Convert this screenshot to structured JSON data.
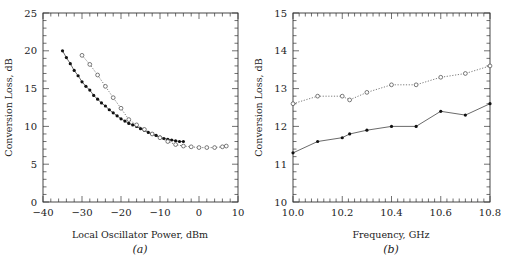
{
  "chart_data": [
    {
      "id": "a",
      "type": "line",
      "caption": "(a)",
      "xlabel": "Local Oscillator Power, dBm",
      "ylabel": "Conversion Loss, dB",
      "xlim": [
        -40,
        10
      ],
      "ylim": [
        0,
        25
      ],
      "xticks": [
        -40,
        -30,
        -20,
        -10,
        0,
        10
      ],
      "xtick_labels": [
        "−40",
        "−30",
        "−20",
        "−10",
        "0",
        "10"
      ],
      "yticks": [
        0,
        5,
        10,
        15,
        20,
        25
      ],
      "ytick_labels": [
        "0",
        "5",
        "10",
        "15",
        "20",
        "25"
      ],
      "grid": false,
      "series": [
        {
          "name": "filled markers (solid line)",
          "marker": "filled-circle",
          "line": "solid",
          "x": [
            -35,
            -34,
            -33,
            -32,
            -31,
            -30,
            -29,
            -28,
            -27,
            -26,
            -25,
            -24,
            -23,
            -22,
            -21,
            -20,
            -19,
            -18,
            -17,
            -16,
            -15,
            -14,
            -13,
            -12,
            -11,
            -10,
            -9,
            -8,
            -7,
            -6,
            -5,
            -4
          ],
          "y": [
            20.0,
            19.1,
            18.3,
            17.4,
            16.7,
            15.9,
            15.3,
            14.8,
            14.1,
            13.6,
            13.1,
            12.7,
            12.2,
            11.8,
            11.4,
            11.0,
            10.7,
            10.4,
            10.2,
            10.0,
            9.7,
            9.5,
            9.2,
            9.0,
            8.8,
            8.6,
            8.4,
            8.3,
            8.2,
            8.1,
            8.0,
            8.0
          ]
        },
        {
          "name": "open markers (dotted line)",
          "marker": "open-circle",
          "line": "dotted",
          "x": [
            -30,
            -28,
            -26,
            -24,
            -22,
            -20,
            -18,
            -16,
            -14,
            -12,
            -10,
            -8,
            -6,
            -4,
            -2,
            0,
            2,
            4,
            6,
            7
          ],
          "y": [
            19.4,
            18.2,
            16.8,
            15.3,
            13.8,
            12.4,
            10.9,
            10.2,
            9.6,
            9.0,
            8.5,
            8.0,
            7.6,
            7.4,
            7.3,
            7.2,
            7.2,
            7.2,
            7.3,
            7.4
          ]
        }
      ]
    },
    {
      "id": "b",
      "type": "line",
      "caption": "(b)",
      "xlabel": "Frequency, GHz",
      "ylabel": "Conversion Loss, dB",
      "xlim": [
        10.0,
        10.8
      ],
      "ylim": [
        10,
        15
      ],
      "xticks": [
        10.0,
        10.2,
        10.4,
        10.6,
        10.8
      ],
      "xtick_labels": [
        "10.0",
        "10.2",
        "10.4",
        "10.6",
        "10.8"
      ],
      "yticks": [
        10,
        11,
        12,
        13,
        14,
        15
      ],
      "ytick_labels": [
        "10",
        "11",
        "12",
        "13",
        "14",
        "15"
      ],
      "grid": false,
      "series": [
        {
          "name": "open markers (dotted line)",
          "marker": "open-circle",
          "line": "dotted",
          "x": [
            10.0,
            10.1,
            10.2,
            10.23,
            10.3,
            10.4,
            10.5,
            10.6,
            10.7,
            10.8
          ],
          "y": [
            12.6,
            12.8,
            12.8,
            12.7,
            12.9,
            13.1,
            13.1,
            13.3,
            13.4,
            13.6
          ]
        },
        {
          "name": "filled markers (solid line)",
          "marker": "filled-circle",
          "line": "solid",
          "x": [
            10.0,
            10.1,
            10.2,
            10.23,
            10.3,
            10.4,
            10.5,
            10.6,
            10.7,
            10.8
          ],
          "y": [
            11.3,
            11.6,
            11.7,
            11.8,
            11.9,
            12.0,
            12.0,
            12.4,
            12.3,
            12.6
          ]
        }
      ]
    }
  ]
}
